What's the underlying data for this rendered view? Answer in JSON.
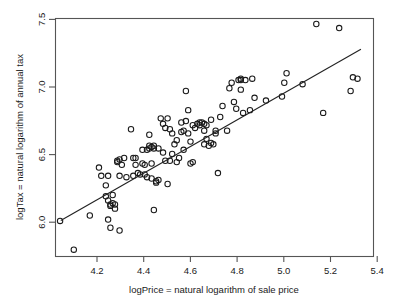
{
  "chart_data": {
    "type": "scatter",
    "title": "",
    "subtitle": "",
    "xlabel": "logPrice = natural logarithm of sale price",
    "ylabel": "logTax = natural logarithm of annual tax",
    "xlim": [
      4.05,
      5.44
    ],
    "ylim": [
      5.78,
      7.52
    ],
    "xticks": [
      4.2,
      4.4,
      4.6,
      4.8,
      5.0,
      5.2,
      5.4
    ],
    "xtick_labels": [
      "4.2",
      "4.4",
      "4.6",
      "4.8",
      "5.0",
      "5.2",
      "5.4"
    ],
    "yticks": [
      6.0,
      6.5,
      7.0,
      7.5
    ],
    "ytick_labels": [
      "6.0",
      "6.5",
      "7.0",
      "7.5"
    ],
    "grid": false,
    "legend": null,
    "marker": "open-circle",
    "marker_color": "#1a1a1a",
    "n_points": 122,
    "annotations": [],
    "fit_line": {
      "type": "linear-regression",
      "color": "#222222",
      "x_start": 4.073,
      "y_start": 6.043,
      "x_end": 5.385,
      "y_end": 7.295
    },
    "x": [
      4.13,
      4.07,
      4.2,
      4.24,
      4.25,
      4.27,
      4.27,
      4.28,
      4.28,
      4.28,
      4.29,
      4.29,
      4.29,
      4.3,
      4.3,
      4.31,
      4.31,
      4.32,
      4.32,
      4.33,
      4.33,
      4.33,
      4.34,
      4.35,
      4.36,
      4.38,
      4.39,
      4.39,
      4.4,
      4.4,
      4.41,
      4.42,
      4.43,
      4.43,
      4.44,
      4.44,
      4.45,
      4.45,
      4.46,
      4.46,
      4.46,
      4.47,
      4.47,
      4.47,
      4.48,
      4.48,
      4.48,
      4.49,
      4.49,
      4.5,
      4.5,
      4.51,
      4.52,
      4.52,
      4.53,
      4.53,
      4.54,
      4.54,
      4.55,
      4.55,
      4.56,
      4.56,
      4.57,
      4.58,
      4.58,
      4.59,
      4.6,
      4.6,
      4.61,
      4.61,
      4.62,
      4.62,
      4.63,
      4.63,
      4.64,
      4.64,
      4.65,
      4.65,
      4.66,
      4.67,
      4.68,
      4.68,
      4.69,
      4.7,
      4.7,
      4.7,
      4.71,
      4.71,
      4.72,
      4.73,
      4.73,
      4.74,
      4.75,
      4.75,
      4.76,
      4.77,
      4.78,
      4.8,
      4.81,
      4.82,
      4.83,
      4.84,
      4.85,
      4.86,
      4.86,
      4.86,
      4.87,
      4.88,
      4.9,
      4.91,
      4.92,
      4.97,
      5.04,
      5.05,
      5.06,
      5.13,
      5.19,
      5.22,
      5.29,
      5.34,
      5.35,
      5.37
    ],
    "y": [
      5.83,
      6.04,
      6.08,
      6.43,
      6.37,
      6.3,
      6.22,
      6.37,
      6.19,
      6.05,
      6.16,
      6.15,
      5.99,
      6.23,
      6.17,
      6.16,
      6.13,
      6.48,
      6.47,
      6.49,
      6.37,
      5.97,
      6.45,
      6.5,
      6.36,
      6.71,
      6.37,
      6.5,
      6.5,
      6.45,
      6.39,
      6.38,
      6.46,
      6.56,
      6.45,
      6.38,
      6.56,
      6.36,
      6.57,
      6.59,
      6.67,
      6.58,
      6.46,
      6.35,
      6.59,
      6.57,
      6.12,
      6.33,
      6.32,
      6.57,
      6.34,
      6.79,
      6.75,
      6.54,
      6.72,
      6.48,
      6.79,
      6.31,
      6.71,
      6.48,
      6.53,
      6.68,
      6.6,
      6.63,
      6.47,
      6.5,
      6.76,
      6.69,
      6.7,
      6.56,
      6.99,
      6.77,
      6.85,
      6.68,
      6.62,
      6.46,
      6.74,
      6.47,
      6.72,
      6.75,
      6.76,
      6.74,
      6.76,
      6.75,
      6.7,
      6.6,
      6.74,
      6.64,
      6.59,
      6.78,
      6.61,
      6.6,
      6.7,
      6.68,
      6.39,
      6.8,
      6.88,
      6.7,
      7.01,
      7.05,
      6.91,
      6.86,
      7.07,
      7.08,
      7.07,
      7.0,
      6.83,
      7.07,
      6.85,
      7.08,
      6.94,
      6.92,
      6.95,
      7.05,
      7.12,
      7.04,
      7.48,
      6.83,
      7.45,
      6.99,
      7.09,
      7.08
    ]
  }
}
